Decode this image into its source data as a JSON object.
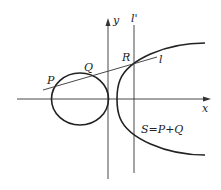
{
  "diagram": {
    "colors": {
      "stroke": "#222222",
      "thin_stroke": "#333333",
      "background": "#ffffff"
    },
    "axes": {
      "x_label": "x",
      "y_label": "y"
    },
    "lines": {
      "secant_label": "l",
      "vertical_label": "l'"
    },
    "points": {
      "p_label": "P",
      "q_label": "Q",
      "r_label": "R"
    },
    "annotation": "S=P+Q"
  }
}
